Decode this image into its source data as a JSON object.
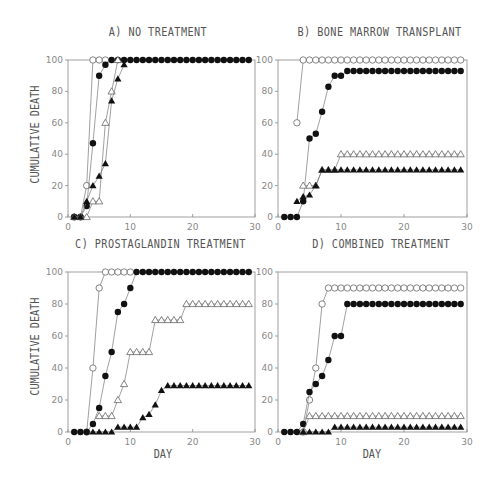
{
  "figure": {
    "ylabel": "CUMULATIVE DEATH",
    "xlabel": "DAY"
  },
  "panels": [
    {
      "title": "A) NO TREATMENT"
    },
    {
      "title": "B) BONE MARROW TRANSPLANT"
    },
    {
      "title": "C) PROSTAGLANDIN TREATMENT"
    },
    {
      "title": "D) COMBINED TREATMENT"
    }
  ],
  "chart_data": [
    {
      "type": "line",
      "title": "A) NO TREATMENT",
      "xlabel": "",
      "ylabel": "CUMULATIVE DEATH",
      "xlim": [
        0,
        30
      ],
      "ylim": [
        0,
        100
      ],
      "xticks": [
        0,
        10,
        20,
        30
      ],
      "yticks": [
        0,
        20,
        40,
        60,
        80,
        100
      ],
      "grid": false,
      "series": [
        {
          "name": "open-circle",
          "marker": "circle-open",
          "x": [
            1,
            2,
            3,
            4,
            5,
            6
          ],
          "y": [
            0,
            0,
            20,
            100,
            100,
            100
          ]
        },
        {
          "name": "filled-circle",
          "marker": "circle-filled",
          "x": [
            1,
            2,
            3,
            4,
            5,
            6,
            7,
            8,
            9,
            10,
            11,
            12,
            13,
            14,
            15,
            16,
            17,
            18,
            19,
            20,
            21,
            22,
            23,
            24,
            25,
            26,
            27,
            28,
            29
          ],
          "y": [
            0,
            0,
            7,
            47,
            90,
            97,
            100,
            100,
            100,
            100,
            100,
            100,
            100,
            100,
            100,
            100,
            100,
            100,
            100,
            100,
            100,
            100,
            100,
            100,
            100,
            100,
            100,
            100,
            100
          ]
        },
        {
          "name": "open-triangle",
          "marker": "triangle-open",
          "x": [
            1,
            2,
            3,
            4,
            5,
            6,
            7,
            8
          ],
          "y": [
            0,
            0,
            0,
            10,
            10,
            60,
            80,
            100
          ]
        },
        {
          "name": "filled-triangle",
          "marker": "triangle-filled",
          "x": [
            1,
            2,
            3,
            4,
            5,
            6,
            7,
            8,
            9
          ],
          "y": [
            0,
            0,
            10,
            20,
            26,
            34,
            74,
            88,
            97
          ]
        }
      ]
    },
    {
      "type": "line",
      "title": "B) BONE MARROW TRANSPLANT",
      "xlabel": "",
      "ylabel": "",
      "xlim": [
        0,
        30
      ],
      "ylim": [
        0,
        100
      ],
      "xticks": [
        0,
        10,
        20,
        30
      ],
      "yticks": [
        0,
        20,
        40,
        60,
        80,
        100
      ],
      "grid": false,
      "series": [
        {
          "name": "open-circle",
          "marker": "circle-open",
          "x": [
            3,
            4,
            5,
            6,
            7,
            8,
            9,
            10,
            11,
            12,
            13,
            14,
            15,
            16,
            17,
            18,
            19,
            20,
            21,
            22,
            23,
            24,
            25,
            26,
            27,
            28,
            29
          ],
          "y": [
            60,
            100,
            100,
            100,
            100,
            100,
            100,
            100,
            100,
            100,
            100,
            100,
            100,
            100,
            100,
            100,
            100,
            100,
            100,
            100,
            100,
            100,
            100,
            100,
            100,
            100,
            100
          ]
        },
        {
          "name": "filled-circle",
          "marker": "circle-filled",
          "x": [
            1,
            2,
            3,
            4,
            5,
            6,
            7,
            8,
            9,
            10,
            11,
            12,
            13,
            14,
            15,
            16,
            17,
            18,
            19,
            20,
            21,
            22,
            23,
            24,
            25,
            26,
            27,
            28,
            29
          ],
          "y": [
            0,
            0,
            0,
            10,
            50,
            53,
            67,
            83,
            90,
            90,
            93,
            93,
            93,
            93,
            93,
            93,
            93,
            93,
            93,
            93,
            93,
            93,
            93,
            93,
            93,
            93,
            93,
            93,
            93
          ]
        },
        {
          "name": "open-triangle",
          "marker": "triangle-open",
          "x": [
            4,
            5,
            6,
            7,
            8,
            9,
            10,
            11,
            12,
            13,
            14,
            15,
            16,
            17,
            18,
            19,
            20,
            21,
            22,
            23,
            24,
            25,
            26,
            27,
            28,
            29
          ],
          "y": [
            20,
            20,
            20,
            30,
            30,
            30,
            40,
            40,
            40,
            40,
            40,
            40,
            40,
            40,
            40,
            40,
            40,
            40,
            40,
            40,
            40,
            40,
            40,
            40,
            40,
            40
          ]
        },
        {
          "name": "filled-triangle",
          "marker": "triangle-filled",
          "x": [
            3,
            4,
            5,
            6,
            7,
            8,
            9,
            10,
            11,
            12,
            13,
            14,
            15,
            16,
            17,
            18,
            19,
            20,
            21,
            22,
            23,
            24,
            25,
            26,
            27,
            28,
            29
          ],
          "y": [
            10,
            13,
            14,
            20,
            30,
            30,
            30,
            30,
            30,
            30,
            30,
            30,
            30,
            30,
            30,
            30,
            30,
            30,
            30,
            30,
            30,
            30,
            30,
            30,
            30,
            30,
            30
          ]
        }
      ]
    },
    {
      "type": "line",
      "title": "C) PROSTAGLANDIN TREATMENT",
      "xlabel": "DAY",
      "ylabel": "CUMULATIVE DEATH",
      "xlim": [
        0,
        30
      ],
      "ylim": [
        0,
        100
      ],
      "xticks": [
        0,
        10,
        20,
        30
      ],
      "yticks": [
        0,
        20,
        40,
        60,
        80,
        100
      ],
      "grid": false,
      "series": [
        {
          "name": "open-circle",
          "marker": "circle-open",
          "x": [
            3,
            4,
            5,
            6,
            7,
            8,
            9,
            10
          ],
          "y": [
            0,
            40,
            90,
            100,
            100,
            100,
            100,
            100
          ]
        },
        {
          "name": "filled-circle",
          "marker": "circle-filled",
          "x": [
            1,
            2,
            3,
            4,
            5,
            6,
            7,
            8,
            9,
            10,
            11,
            12,
            13,
            14,
            15,
            16,
            17,
            18,
            19,
            20,
            21,
            22,
            23,
            24,
            25,
            26,
            27,
            28,
            29
          ],
          "y": [
            0,
            0,
            0,
            5,
            15,
            35,
            50,
            75,
            80,
            90,
            100,
            100,
            100,
            100,
            100,
            100,
            100,
            100,
            100,
            100,
            100,
            100,
            100,
            100,
            100,
            100,
            100,
            100,
            100
          ]
        },
        {
          "name": "open-triangle",
          "marker": "triangle-open",
          "x": [
            5,
            6,
            7,
            8,
            9,
            10,
            11,
            12,
            13,
            14,
            15,
            16,
            17,
            18,
            19,
            20,
            21,
            22,
            23,
            24,
            25,
            26,
            27,
            28,
            29
          ],
          "y": [
            10,
            10,
            10,
            20,
            30,
            50,
            50,
            50,
            50,
            70,
            70,
            70,
            70,
            70,
            80,
            80,
            80,
            80,
            80,
            80,
            80,
            80,
            80,
            80,
            80
          ]
        },
        {
          "name": "filled-triangle",
          "marker": "triangle-filled",
          "x": [
            4,
            5,
            6,
            7,
            8,
            9,
            10,
            11,
            12,
            13,
            14,
            15,
            16,
            17,
            18,
            19,
            20,
            21,
            22,
            23,
            24,
            25,
            26,
            27,
            28,
            29
          ],
          "y": [
            0,
            0,
            0,
            0,
            3,
            3,
            3,
            3,
            9,
            11,
            17,
            26,
            29,
            29,
            29,
            29,
            29,
            29,
            29,
            29,
            29,
            29,
            29,
            29,
            29,
            29
          ]
        }
      ]
    },
    {
      "type": "line",
      "title": "D) COMBINED TREATMENT",
      "xlabel": "DAY",
      "ylabel": "",
      "xlim": [
        0,
        30
      ],
      "ylim": [
        0,
        100
      ],
      "xticks": [
        0,
        10,
        20,
        30
      ],
      "yticks": [
        0,
        20,
        40,
        60,
        80,
        100
      ],
      "grid": false,
      "series": [
        {
          "name": "open-circle",
          "marker": "circle-open",
          "x": [
            4,
            5,
            6,
            7,
            8,
            9,
            10,
            11,
            12,
            13,
            14,
            15,
            16,
            17,
            18,
            19,
            20,
            21,
            22,
            23,
            24,
            25,
            26,
            27,
            28,
            29
          ],
          "y": [
            0,
            20,
            40,
            80,
            90,
            90,
            90,
            90,
            90,
            90,
            90,
            90,
            90,
            90,
            90,
            90,
            90,
            90,
            90,
            90,
            90,
            90,
            90,
            90,
            90,
            90
          ]
        },
        {
          "name": "filled-circle",
          "marker": "circle-filled",
          "x": [
            1,
            2,
            3,
            4,
            5,
            6,
            7,
            8,
            9,
            10,
            11,
            12,
            13,
            14,
            15,
            16,
            17,
            18,
            19,
            20,
            21,
            22,
            23,
            24,
            25,
            26,
            27,
            28,
            29
          ],
          "y": [
            0,
            0,
            0,
            5,
            25,
            30,
            35,
            45,
            60,
            60,
            80,
            80,
            80,
            80,
            80,
            80,
            80,
            80,
            80,
            80,
            80,
            80,
            80,
            80,
            80,
            80,
            80,
            80,
            80
          ]
        },
        {
          "name": "open-triangle",
          "marker": "triangle-open",
          "x": [
            4,
            5,
            6,
            7,
            8,
            9,
            10,
            11,
            12,
            13,
            14,
            15,
            16,
            17,
            18,
            19,
            20,
            21,
            22,
            23,
            24,
            25,
            26,
            27,
            28,
            29
          ],
          "y": [
            0,
            10,
            10,
            10,
            10,
            10,
            10,
            10,
            10,
            10,
            10,
            10,
            10,
            10,
            10,
            10,
            10,
            10,
            10,
            10,
            10,
            10,
            10,
            10,
            10,
            10
          ]
        },
        {
          "name": "filled-triangle",
          "marker": "triangle-filled",
          "x": [
            4,
            5,
            6,
            7,
            8,
            9,
            10,
            11,
            12,
            13,
            14,
            15,
            16,
            17,
            18,
            19,
            20,
            21,
            22,
            23,
            24,
            25,
            26,
            27,
            28,
            29
          ],
          "y": [
            0,
            0,
            0,
            0,
            0,
            3,
            3,
            3,
            3,
            3,
            3,
            3,
            3,
            3,
            3,
            3,
            3,
            3,
            3,
            3,
            3,
            3,
            3,
            3,
            3,
            3
          ]
        }
      ]
    }
  ]
}
